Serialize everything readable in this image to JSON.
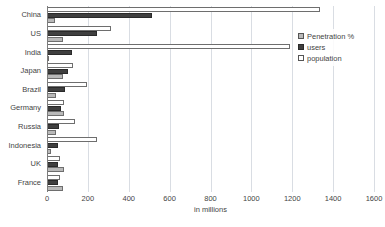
{
  "chart_data": {
    "type": "bar",
    "orientation": "horizontal",
    "title": "",
    "xlabel": "in millions",
    "ylabel": "",
    "xlim": [
      0,
      1600
    ],
    "xticks": [
      0,
      200,
      400,
      600,
      800,
      1000,
      1200,
      1400,
      1600
    ],
    "xtick_labels": [
      "0",
      "200",
      "400",
      "600",
      "800",
      "1000",
      "1200",
      "1400",
      "1600"
    ],
    "grid": true,
    "grid_axis": "x",
    "legend_position": "upper right",
    "categories": [
      "China",
      "US",
      "India",
      "Japan",
      "Brazil",
      "Germany",
      "Russia",
      "Indonesia",
      "UK",
      "France"
    ],
    "series": [
      {
        "name": "Penetration %",
        "color": "#b9b9b9",
        "values": [
          38,
          78,
          10,
          79,
          45,
          83,
          43,
          22,
          84,
          80
        ]
      },
      {
        "name": "users",
        "color": "#3f3f3f",
        "values": [
          513,
          245,
          121,
          101,
          88,
          67,
          60,
          55,
          52,
          52
        ]
      },
      {
        "name": "population",
        "color": "#ffffff",
        "values": [
          1336,
          313,
          1189,
          127,
          194,
          82,
          139,
          245,
          63,
          65
        ]
      }
    ]
  },
  "legend": {
    "items": [
      {
        "label": "Penetration %",
        "swatch": "penetration-swatch"
      },
      {
        "label": "users",
        "swatch": "users-swatch"
      },
      {
        "label": "population",
        "swatch": "population-swatch"
      }
    ]
  },
  "axis": {
    "x_title": "in millions"
  }
}
